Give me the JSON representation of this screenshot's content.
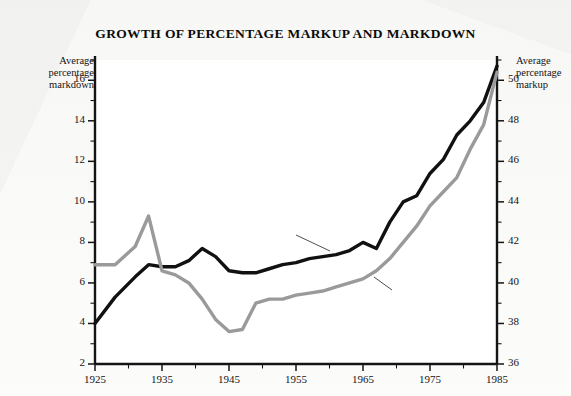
{
  "title": "GROWTH OF PERCENTAGE MARKUP AND MARKDOWN",
  "axis_captions": {
    "left": "Average\npercentage\nmarkdown",
    "right": "Average\npercentage\nmarkup"
  },
  "annotations": {
    "markup": "Percent\nmarkup",
    "markdown": "Percent\nmarkdown"
  },
  "colors": {
    "markup_line": "#111111",
    "markdown_line": "#9a9a9a",
    "axis": "#141414",
    "plot_background": "#ffffff",
    "page_background": "#fbfbfa"
  },
  "chart_data": {
    "type": "line",
    "title": "GROWTH OF PERCENTAGE MARKUP AND MARKDOWN",
    "xlabel": "",
    "ylabel": "Average percentage markdown",
    "y2label": "Average percentage markup",
    "xlim": [
      1925,
      1985
    ],
    "ylim": [
      2,
      17
    ],
    "y2lim": [
      36,
      51
    ],
    "xticks": [
      1925,
      1935,
      1945,
      1955,
      1965,
      1975,
      1985
    ],
    "xticks_minor": [
      1930,
      1940,
      1950,
      1960,
      1970,
      1980
    ],
    "yticks_left": [
      2,
      4,
      6,
      8,
      10,
      12,
      14,
      16
    ],
    "yticks_right": [
      36,
      38,
      40,
      42,
      44,
      46,
      48,
      50
    ],
    "grid": false,
    "legend": "annotated-inline",
    "series": [
      {
        "name": "Percent markup",
        "axis": "right",
        "color": "#111111",
        "x": [
          1925,
          1928,
          1931,
          1933,
          1935,
          1937,
          1939,
          1941,
          1943,
          1945,
          1947,
          1949,
          1951,
          1953,
          1955,
          1957,
          1959,
          1961,
          1963,
          1965,
          1967,
          1969,
          1971,
          1973,
          1975,
          1977,
          1979,
          1981,
          1983,
          1985
        ],
        "values": [
          38.0,
          39.3,
          40.3,
          40.9,
          40.8,
          40.8,
          41.1,
          41.7,
          41.3,
          40.6,
          40.5,
          40.5,
          40.7,
          40.9,
          41.0,
          41.2,
          41.3,
          41.4,
          41.6,
          42.0,
          41.7,
          43.0,
          44.0,
          44.3,
          45.4,
          46.1,
          47.3,
          48.0,
          48.9,
          50.7
        ]
      },
      {
        "name": "Percent markdown",
        "axis": "left",
        "color": "#9a9a9a",
        "x": [
          1925,
          1928,
          1931,
          1933,
          1935,
          1937,
          1939,
          1941,
          1943,
          1945,
          1947,
          1949,
          1951,
          1953,
          1955,
          1957,
          1959,
          1961,
          1963,
          1965,
          1967,
          1969,
          1971,
          1973,
          1975,
          1977,
          1979,
          1981,
          1983,
          1985
        ],
        "values": [
          6.9,
          6.9,
          7.8,
          9.3,
          6.6,
          6.4,
          6.0,
          5.2,
          4.2,
          3.6,
          3.7,
          5.0,
          5.2,
          5.2,
          5.4,
          5.5,
          5.6,
          5.8,
          6.0,
          6.2,
          6.6,
          7.2,
          8.0,
          8.8,
          9.8,
          10.5,
          11.2,
          12.6,
          13.8,
          16.4
        ]
      }
    ]
  }
}
